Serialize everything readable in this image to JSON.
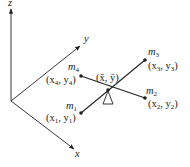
{
  "diagram": {
    "axes": {
      "z": {
        "label": "z"
      },
      "y": {
        "label": "y"
      },
      "x": {
        "label": "x"
      }
    },
    "center": {
      "label": "(x̄, ȳ)"
    },
    "masses": [
      {
        "name": "m1",
        "mass_label": "m",
        "mass_sub": "1",
        "coord_label": "(x",
        "coord_sub1": "1",
        "coord_mid": ", y",
        "coord_sub2": "1",
        "coord_end": ")"
      },
      {
        "name": "m2",
        "mass_label": "m",
        "mass_sub": "2",
        "coord_label": "(x",
        "coord_sub1": "2",
        "coord_mid": ", y",
        "coord_sub2": "2",
        "coord_end": ")"
      },
      {
        "name": "m3",
        "mass_label": "m",
        "mass_sub": "3",
        "coord_label": "(x",
        "coord_sub1": "3",
        "coord_mid": ", y",
        "coord_sub2": "3",
        "coord_end": ")"
      },
      {
        "name": "m4",
        "mass_label": "m",
        "mass_sub": "4",
        "coord_label": "(x",
        "coord_sub1": "4",
        "coord_mid": ", y",
        "coord_sub2": "4",
        "coord_end": ")"
      }
    ],
    "colors": {
      "line": "#222222",
      "background": "#ffffff"
    }
  }
}
